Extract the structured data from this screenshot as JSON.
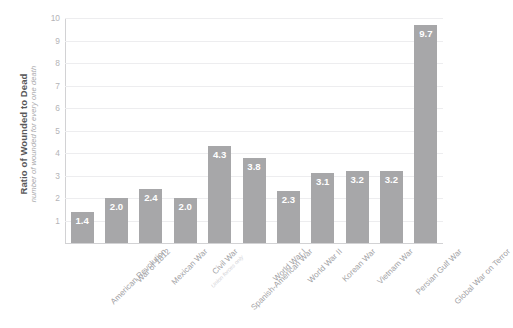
{
  "chart_data": {
    "type": "bar",
    "title": "",
    "subtitle": "",
    "xlabel": "",
    "ylabel": "Ratio of Wounded to Dead",
    "ylabel_sub": "number of wounded for every one death",
    "ylim": [
      0,
      10
    ],
    "yticks": [
      1,
      2,
      3,
      4,
      5,
      6,
      7,
      8,
      9,
      10
    ],
    "ytick_labels": [
      "1",
      "2",
      "3",
      "4",
      "5",
      "6",
      "7",
      "8",
      "9",
      "10"
    ],
    "grid": true,
    "legend": "none",
    "categories": [
      "American Revolution",
      "War of 1812",
      "Mexican War",
      "Civil War",
      "Spanish-American War",
      "World War I",
      "World War II",
      "Korean War",
      "Vietnam War",
      "Persian Gulf War",
      "Global War on Terror"
    ],
    "category_notes": [
      "",
      "",
      "",
      "Union forces only",
      "",
      "",
      "",
      "",
      "",
      "",
      ""
    ],
    "values": [
      1.4,
      2.0,
      2.4,
      2.0,
      4.3,
      3.8,
      2.3,
      3.1,
      3.2,
      3.2,
      9.7
    ],
    "value_labels": [
      "1.4",
      "2.0",
      "2.4",
      "2.0",
      "4.3",
      "3.8",
      "2.3",
      "3.1",
      "3.2",
      "3.2",
      "9.7"
    ],
    "bar_color": "#a7a7a9",
    "value_label_color": "#ffffff",
    "gridline_color": "#ededef",
    "axis_color": "#d2d2d4",
    "tick_label_color": "#b4b4b7",
    "category_label_color": "#a2a2a5",
    "background_color": "#ffffff"
  }
}
